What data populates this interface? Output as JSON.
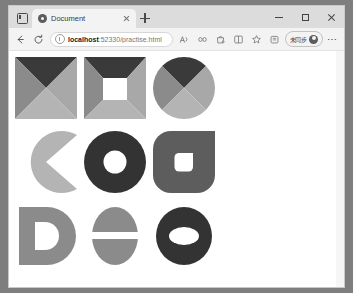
{
  "browser": {
    "name": "microsoft-edge",
    "tab": {
      "title": "Document",
      "favicon": "document-favicon",
      "close_label": "×"
    },
    "new_tab_label": "+",
    "tab_search_icon": "tab-search-icon",
    "window_controls": {
      "minimize": "–",
      "maximize": "☐",
      "close": "×"
    },
    "toolbar": {
      "back_icon": "back-arrow-icon",
      "refresh_icon": "refresh-icon",
      "site_info_icon": "info-circle-icon",
      "read_aloud_icon": "read-aloud-icon",
      "copilot_icon": "copilot-icon",
      "shopping_icon": "shopping-bag-icon",
      "split_screen_icon": "split-screen-icon",
      "favorite_icon": "favorites-star-icon",
      "collections_icon": "collections-icon",
      "settings_icon": "more-options-icon",
      "ellipsis_label": "⋯"
    },
    "address_bar": {
      "host": "localhost",
      "rest": ":52330/practise.html",
      "full_url": "localhost:52330/practise.html",
      "placeholder": "Search or enter web address"
    },
    "profile": {
      "label": "未同步",
      "avatar_icon": "profile-avatar-icon"
    }
  },
  "colors": {
    "dark": "#3a3a3a",
    "charcoal": "#333333",
    "mid_gray": "#8b8b8b",
    "light_gray": "#a8a8a8",
    "pale_gray": "#b4b4b4",
    "deep_gray": "#5d5d5d",
    "white": "#ffffff",
    "page_bg": "#ffffff"
  },
  "page": {
    "title": "Document",
    "shapes": [
      {
        "id": "square-four-triangles",
        "name": "square-four-triangles",
        "row": 1,
        "col": 1,
        "base": "square",
        "parts": [
          "top-triangle",
          "left-triangle",
          "right-triangle",
          "bottom-triangle"
        ],
        "fills": [
          "#3a3a3a",
          "#8b8b8b",
          "#a8a8a8",
          "#b4b4b4"
        ]
      },
      {
        "id": "square-four-trapezoids",
        "name": "square-four-trapezoids-with-white-center",
        "row": 1,
        "col": 2,
        "base": "square",
        "parts": [
          "top-trapezoid",
          "left-trapezoid",
          "right-trapezoid",
          "bottom-trapezoid",
          "center-square-hole"
        ],
        "fills": [
          "#3a3a3a",
          "#8b8b8b",
          "#a8a8a8",
          "#b4b4b4",
          "#ffffff"
        ]
      },
      {
        "id": "circle-four-triangles",
        "name": "circle-four-wedges",
        "row": 1,
        "col": 3,
        "base": "circle",
        "parts": [
          "top-wedge",
          "left-wedge",
          "right-wedge",
          "bottom-wedge"
        ],
        "fills": [
          "#3a3a3a",
          "#8b8b8b",
          "#a8a8a8",
          "#b4b4b4"
        ]
      },
      {
        "id": "pacman-wedge",
        "name": "pacman-circle-mouth-right",
        "row": 2,
        "col": 1,
        "base": "circle",
        "parts": [
          "circle-minus-wedge"
        ],
        "fills": [
          "#b4b4b4"
        ]
      },
      {
        "id": "donut-circle",
        "name": "donut-circle-white-hole",
        "row": 2,
        "col": 2,
        "base": "circle",
        "parts": [
          "outer-circle",
          "inner-circle-hole"
        ],
        "fills": [
          "#333333",
          "#ffffff"
        ]
      },
      {
        "id": "rounded-blob",
        "name": "rounded-square-with-notch-hole",
        "row": 2,
        "col": 3,
        "base": "rounded-square",
        "parts": [
          "outer-rounded-square",
          "inner-rounded-hole"
        ],
        "fills": [
          "#5d5d5d",
          "#ffffff"
        ]
      },
      {
        "id": "letter-d",
        "name": "letter-d-shape",
        "row": 3,
        "col": 1,
        "base": "letter",
        "parts": [
          "d-stem",
          "d-bowl",
          "d-counter-hole"
        ],
        "fills": [
          "#8b8b8b",
          "#8b8b8b",
          "#ffffff"
        ]
      },
      {
        "id": "split-ellipse",
        "name": "ellipse-split-horizontal-gap",
        "row": 3,
        "col": 2,
        "base": "ellipse",
        "parts": [
          "upper-half",
          "white-band",
          "lower-half"
        ],
        "fills": [
          "#8b8b8b",
          "#ffffff",
          "#8b8b8b"
        ]
      },
      {
        "id": "ellipse-donut",
        "name": "ellipse-donut-white-hole",
        "row": 3,
        "col": 3,
        "base": "ellipse",
        "parts": [
          "outer-ellipse",
          "inner-ellipse-hole"
        ],
        "fills": [
          "#333333",
          "#ffffff"
        ]
      }
    ]
  }
}
